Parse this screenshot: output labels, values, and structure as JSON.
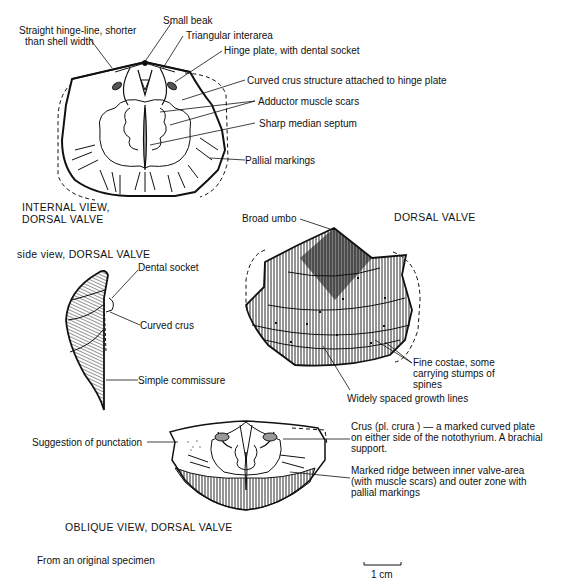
{
  "figure": {
    "panels": [
      {
        "id": "internal",
        "caption_line1": "INTERNAL VIEW,",
        "caption_line2": "DORSAL VALVE",
        "labels": [
          {
            "key": "hinge_line_1",
            "text": "Straight hinge-line, shorter"
          },
          {
            "key": "hinge_line_2",
            "text": "than shell width"
          },
          {
            "key": "beak",
            "text": "Small beak"
          },
          {
            "key": "interarea",
            "text": "Triangular interarea"
          },
          {
            "key": "hinge_plate",
            "text": "Hinge plate, with dental socket"
          },
          {
            "key": "crus_structure",
            "text": "Curved crus structure attached to hinge plate"
          },
          {
            "key": "adductor",
            "text": "Adductor muscle scars"
          },
          {
            "key": "septum",
            "text": "Sharp median septum"
          },
          {
            "key": "pallial",
            "text": "Pallial markings"
          }
        ]
      },
      {
        "id": "exterior",
        "caption": "DORSAL VALVE",
        "labels": [
          {
            "key": "umbo",
            "text": "Broad umbo"
          },
          {
            "key": "costae_1",
            "text": "Fine costae, some"
          },
          {
            "key": "costae_2",
            "text": "carrying stumps of"
          },
          {
            "key": "costae_3",
            "text": "spines"
          },
          {
            "key": "growth",
            "text": "Widely spaced growth lines"
          }
        ]
      },
      {
        "id": "side",
        "caption": "side view, DORSAL VALVE",
        "labels": [
          {
            "key": "dental_socket",
            "text": "Dental socket"
          },
          {
            "key": "curved_crus",
            "text": "Curved crus"
          },
          {
            "key": "commissure",
            "text": "Simple commissure"
          }
        ]
      },
      {
        "id": "oblique",
        "caption": "OBLIQUE VIEW, DORSAL VALVE",
        "labels": [
          {
            "key": "punctation",
            "text": "Suggestion of punctation"
          },
          {
            "key": "crus_1",
            "text": "Crus (pl. crura ) — a marked curved plate"
          },
          {
            "key": "crus_2",
            "text": "on either side of the notothyrium. A brachial"
          },
          {
            "key": "crus_3",
            "text": "support."
          },
          {
            "key": "ridge_1",
            "text": "Marked ridge between inner valve-area"
          },
          {
            "key": "ridge_2",
            "text": "(with muscle scars) and outer zone with"
          },
          {
            "key": "ridge_3",
            "text": "pallial markings"
          }
        ]
      }
    ],
    "source_note": "From an original specimen",
    "scale_bar": "1 cm"
  }
}
